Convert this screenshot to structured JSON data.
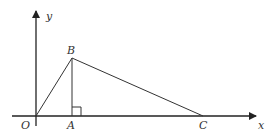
{
  "diagram": {
    "type": "coordinate-geometry",
    "axes": {
      "x_label": "x",
      "y_label": "y",
      "origin_label": "O"
    },
    "points": {
      "O": {
        "label": "O"
      },
      "A": {
        "label": "A"
      },
      "B": {
        "label": "B"
      },
      "C": {
        "label": "C"
      }
    },
    "segments": [
      "OB",
      "BC",
      "BA"
    ],
    "right_angle_at": "A",
    "colors": {
      "stroke": "#333333",
      "background": "#ffffff"
    }
  }
}
